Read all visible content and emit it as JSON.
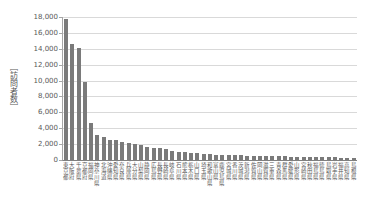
{
  "chart_data": {
    "type": "bar",
    "title": "",
    "xlabel": "",
    "ylabel": "［訪問者数］",
    "ylim": [
      0,
      18000
    ],
    "ytick_interval": 2000,
    "ytick_labels": [
      "0",
      "2,000",
      "4,000",
      "6,000",
      "8,000",
      "10,000",
      "12,000",
      "14,000",
      "16,000",
      "18,000"
    ],
    "grid": true,
    "legend_position": "none",
    "bar_color": "#7a7a7a",
    "gridline_color": "#d9d9d9",
    "axis_color": "#a6a6a6",
    "text_color": "#595959",
    "categories": [
      "東京都",
      "大阪府",
      "千葉県",
      "京都府",
      "福岡県",
      "神奈川県",
      "北海道",
      "沖縄県",
      "愛知県",
      "奈良県",
      "兵庫県",
      "大分県",
      "山梨県",
      "静岡県",
      "広島県",
      "長野県",
      "長崎県",
      "岐阜県",
      "石川県",
      "熊本県",
      "栃木県",
      "山口県",
      "埼玉県",
      "和歌山県",
      "富山県",
      "鹿児島県",
      "宮城県",
      "香川県",
      "茨城県",
      "新潟県",
      "佐賀県",
      "岡山県",
      "滋賀県",
      "三重県",
      "青森県",
      "群馬県",
      "愛媛県",
      "山形県",
      "宮崎県",
      "秋田県",
      "福島県",
      "徳島県",
      "鳥取県",
      "岩手県",
      "福井県",
      "高知県",
      "島根県"
    ],
    "values": [
      17700,
      14600,
      14100,
      9800,
      4650,
      3200,
      2850,
      2550,
      2480,
      2230,
      2100,
      2050,
      1850,
      1700,
      1550,
      1450,
      1350,
      1150,
      1000,
      950,
      890,
      860,
      780,
      750,
      690,
      650,
      620,
      590,
      570,
      550,
      530,
      510,
      490,
      470,
      460,
      450,
      430,
      420,
      400,
      390,
      370,
      360,
      340,
      330,
      310,
      300,
      290
    ]
  }
}
